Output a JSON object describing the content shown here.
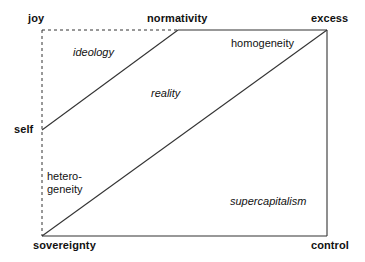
{
  "diagram": {
    "background_color": "#ffffff",
    "line_color": "#333333",
    "corner_labels": {
      "top_left": "joy",
      "top_mid": "normativity",
      "top_right": "excess",
      "left_mid": "self",
      "bottom_left": "sovereignty",
      "bottom_right": "control"
    },
    "region_labels": {
      "ideology": "ideology",
      "homogeneity": "homogeneity",
      "reality": "reality",
      "heterogeneity": "hetero-\ngeneity",
      "supercapitalism": "supercapitalism"
    },
    "geometry": {
      "frame_left_x": 42,
      "frame_right_x": 327,
      "frame_top_y": 30,
      "frame_bottom_y": 236,
      "normativity_x": 178,
      "self_y": 130,
      "dashed_edges": [
        "left-vertical",
        "top-left-segment"
      ],
      "solid_edges": [
        "top-right-segment",
        "right-vertical",
        "bottom-horizontal"
      ],
      "diagonals": [
        {
          "name": "self-to-normativity",
          "from": [
            42,
            130
          ],
          "to": [
            178,
            30
          ]
        },
        {
          "name": "sovereignty-to-excess",
          "from": [
            42,
            236
          ],
          "to": [
            327,
            30
          ]
        }
      ]
    }
  }
}
